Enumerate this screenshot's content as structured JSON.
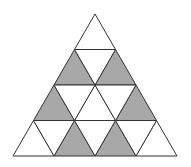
{
  "diagram": {
    "title": "",
    "rows": 4,
    "apex": [
      95,
      14
    ],
    "base_left": [
      13,
      156
    ],
    "base_right": [
      177,
      156
    ],
    "colors": {
      "shaded": "#a8a8a8",
      "unshaded": "#ffffff",
      "stroke": "#333333"
    },
    "shaded_cells": [
      {
        "row": 2,
        "index": 1,
        "orientation": "up"
      },
      {
        "row": 2,
        "index": 2,
        "orientation": "up"
      },
      {
        "row": 3,
        "index": 1,
        "orientation": "up"
      },
      {
        "row": 3,
        "index": 3,
        "orientation": "up"
      },
      {
        "row": 4,
        "index": 2,
        "orientation": "up"
      },
      {
        "row": 4,
        "index": 3,
        "orientation": "up"
      }
    ]
  }
}
